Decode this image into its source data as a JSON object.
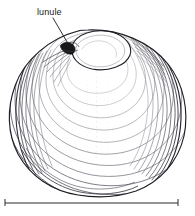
{
  "figure": {
    "type": "scientific-line-illustration",
    "background_color": "#ffffff",
    "ink_color": "#1a1a1d",
    "shading_color": "#5a5a60",
    "faint_color": "#a8a8ae"
  },
  "annotations": [
    {
      "id": "lunule",
      "label": "lunule",
      "text_x": 37,
      "text_y": 15,
      "leader_from": [
        53,
        18
      ],
      "leader_to": [
        70,
        47
      ],
      "target": "heart-shaped depression anterior to the umbo"
    }
  ],
  "scale_bar": {
    "label": "",
    "x_start": 5,
    "x_end": 178,
    "y": 203,
    "tick_height": 6,
    "color": "#2a2a30"
  },
  "shell": {
    "outline_bounds": {
      "left": 8,
      "top": 28,
      "right": 188,
      "bottom": 196
    },
    "umbo": {
      "x": 88,
      "y": 34
    },
    "growth_line_count": 22,
    "description": "Concentric growth lines radiating from the dorsal umbo, dense dark bundling along the anterior (left) and posterior (right) margins."
  }
}
